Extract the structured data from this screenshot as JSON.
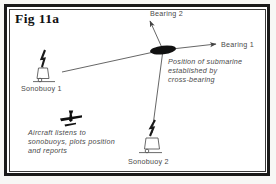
{
  "figure": {
    "title": "Fig 11a",
    "labels": {
      "bearing1": "Bearing 1",
      "bearing2": "Bearing 2",
      "sonobuoy1": "Sonobuoy 1",
      "sonobuoy2": "Sonobuoy 2"
    },
    "caption_submarine": [
      "Position of submarine",
      "established by",
      "cross-bearing"
    ],
    "caption_aircraft": [
      "Aircraft listens to",
      "sonobuoys, plots position",
      "and reports"
    ],
    "colors": {
      "frame": "#1a1a1a",
      "ink": "#4a4a4a",
      "line": "#555555",
      "submarine": "#111111",
      "background": "#ffffff"
    },
    "icons": {
      "sonobuoy1": "sonobuoy-icon",
      "sonobuoy2": "sonobuoy-icon",
      "aircraft": "aircraft-icon",
      "submarine": "submarine-marker"
    }
  }
}
